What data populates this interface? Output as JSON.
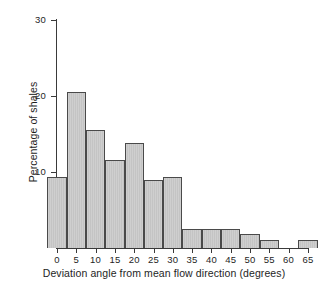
{
  "chart_data": {
    "type": "bar",
    "title": "",
    "subtitle": "",
    "xlabel": "Deviation angle from mean flow direction (degrees)",
    "ylabel": "Percentage of shales",
    "xlim": [
      -2.5,
      70
    ],
    "ylim": [
      0,
      30
    ],
    "xticks": [
      0,
      5,
      10,
      15,
      20,
      25,
      30,
      35,
      40,
      45,
      50,
      55,
      60,
      65
    ],
    "xtick_labels": [
      "0",
      "5",
      "10",
      "15",
      "20",
      "25",
      "30",
      "35",
      "40",
      "45",
      "50",
      "55",
      "60",
      "65"
    ],
    "yticks": [
      10,
      20,
      30
    ],
    "ytick_labels": [
      "10",
      "20",
      "30"
    ],
    "grid": false,
    "legend": null,
    "bin_width": 5,
    "bin_starts": [
      -2.5,
      2.5,
      7.5,
      12.5,
      17.5,
      22.5,
      27.5,
      32.5,
      37.5,
      42.5,
      47.5,
      52.5,
      57.5,
      62.5
    ],
    "bin_labels": [
      "-2.5 to 2.5",
      "2.5 to 7.5",
      "7.5 to 12.5",
      "12.5 to 17.5",
      "17.5 to 22.5",
      "22.5 to 27.5",
      "27.5 to 32.5",
      "32.5 to 37.5",
      "37.5 to 42.5",
      "42.5 to 47.5",
      "47.5 to 52.5",
      "52.5 to 57.5",
      "57.5 to 62.5",
      "62.5 to 67.5"
    ],
    "values": [
      9.3,
      20.5,
      15.5,
      11.6,
      13.8,
      8.9,
      9.3,
      2.5,
      2.5,
      2.5,
      1.8,
      1.0,
      0,
      1.0
    ],
    "colors": {
      "bar_fill": "#c9c9c9",
      "bar_edge": "#4a4a4a",
      "axis": "#3a3a3a",
      "text": "#1e1e1e",
      "background": "#ffffff"
    }
  }
}
